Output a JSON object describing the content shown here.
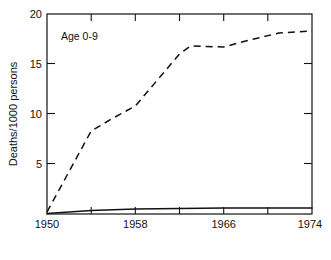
{
  "chart_data": {
    "type": "line",
    "title": "",
    "subtitle": "",
    "annotation": "Age 0-9",
    "xlabel": "",
    "ylabel": "Deaths/1000 persons",
    "xlim": [
      1950,
      1974
    ],
    "ylim": [
      0,
      20
    ],
    "grid": false,
    "legend_position": "none",
    "x_ticks_labeled": [
      1950,
      1958,
      1966,
      1974
    ],
    "x_tick_labels": [
      "1950",
      "1958",
      "1966",
      "1974"
    ],
    "x_ticks_minor": [
      1954,
      1962,
      1970
    ],
    "y_ticks_labeled": [
      0,
      5,
      10,
      15,
      20
    ],
    "y_tick_labels": [
      "",
      "5",
      "10",
      "15",
      "20"
    ],
    "series": [
      {
        "name": "dashed-series",
        "style": "dashed",
        "x": [
          1950,
          1954,
          1956,
          1958,
          1960,
          1962,
          1963,
          1966,
          1968,
          1971,
          1974
        ],
        "values": [
          0.2,
          8.3,
          9.6,
          10.8,
          13.4,
          16.0,
          16.8,
          16.7,
          17.3,
          18.1,
          18.3
        ]
      },
      {
        "name": "solid-series",
        "style": "solid",
        "x": [
          1950,
          1954,
          1958,
          1962,
          1966,
          1970,
          1974
        ],
        "values": [
          0.05,
          0.35,
          0.5,
          0.55,
          0.6,
          0.6,
          0.6
        ]
      }
    ]
  },
  "figure": {
    "annotation_label": "Age 0-9",
    "y_axis_title": "Deaths/1000 persons",
    "y_label_20": "20",
    "y_label_15": "15",
    "y_label_10": "10",
    "y_label_5": "5",
    "x_label_1950": "1950",
    "x_label_1958": "1958",
    "x_label_1966": "1966",
    "x_label_1974": "1974"
  },
  "colors": {
    "ink": "#111111",
    "background": "#ffffff"
  }
}
